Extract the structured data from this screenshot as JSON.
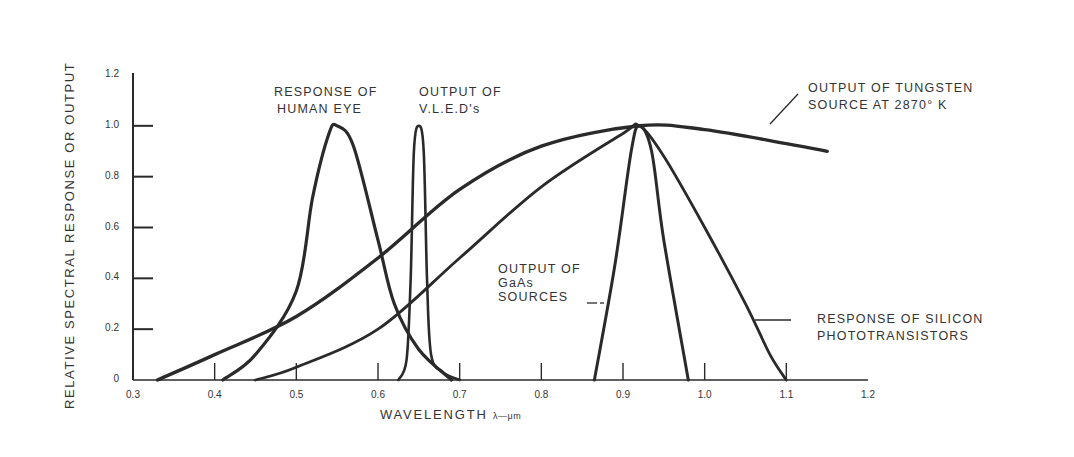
{
  "chart_data": {
    "type": "line",
    "title": "",
    "xlabel": "WAVELENGTH",
    "xlabel_unit": "λ—μm",
    "ylabel": "RELATIVE SPECTRAL RESPONSE OR OUTPUT",
    "xlim": [
      0.3,
      1.2
    ],
    "ylim": [
      0,
      1.2
    ],
    "grid": false,
    "x_ticks": [
      "0.3",
      "0.4",
      "0.5",
      "0.6",
      "0.7",
      "0.8",
      "0.9",
      "1.0",
      "1.1",
      "1.2"
    ],
    "y_ticks": [
      "0",
      "0.2",
      "0.4",
      "0.6",
      "0.8",
      "1.0",
      "1.2"
    ],
    "series": [
      {
        "name": "Response of Human Eye",
        "label": [
          "RESPONSE OF",
          "HUMAN EYE"
        ],
        "points": [
          [
            0.41,
            0.0
          ],
          [
            0.45,
            0.1
          ],
          [
            0.5,
            0.35
          ],
          [
            0.52,
            0.72
          ],
          [
            0.54,
            0.97
          ],
          [
            0.55,
            1.0
          ],
          [
            0.57,
            0.92
          ],
          [
            0.6,
            0.55
          ],
          [
            0.62,
            0.3
          ],
          [
            0.65,
            0.12
          ],
          [
            0.69,
            0.0
          ]
        ]
      },
      {
        "name": "Output of V.L.E.D's",
        "label": [
          "OUTPUT OF",
          "V.L.E.D's"
        ],
        "points": [
          [
            0.625,
            0.0
          ],
          [
            0.635,
            0.08
          ],
          [
            0.64,
            0.4
          ],
          [
            0.644,
            0.9
          ],
          [
            0.65,
            1.0
          ],
          [
            0.656,
            0.9
          ],
          [
            0.66,
            0.4
          ],
          [
            0.665,
            0.1
          ],
          [
            0.68,
            0.03
          ],
          [
            0.7,
            0.0
          ]
        ]
      },
      {
        "name": "Output of Tungsten Source at 2870°K",
        "label": [
          "OUTPUT OF TUNGSTEN",
          "SOURCE AT 2870° K"
        ],
        "points": [
          [
            0.33,
            0.0
          ],
          [
            0.4,
            0.1
          ],
          [
            0.5,
            0.25
          ],
          [
            0.6,
            0.48
          ],
          [
            0.7,
            0.75
          ],
          [
            0.8,
            0.92
          ],
          [
            0.92,
            1.0
          ],
          [
            1.0,
            0.985
          ],
          [
            1.1,
            0.93
          ],
          [
            1.15,
            0.9
          ]
        ]
      },
      {
        "name": "Output of GaAs Sources",
        "label": [
          "OUTPUT OF",
          "GaAs",
          "SOURCES"
        ],
        "points": [
          [
            0.865,
            0.0
          ],
          [
            0.89,
            0.45
          ],
          [
            0.91,
            0.9
          ],
          [
            0.92,
            1.0
          ],
          [
            0.935,
            0.9
          ],
          [
            0.95,
            0.55
          ],
          [
            0.98,
            0.0
          ]
        ]
      },
      {
        "name": "Response of Silicon Phototransistors",
        "label": [
          "RESPONSE OF SILICON",
          "PHOTOTRANSISTORS"
        ],
        "points": [
          [
            0.45,
            0.0
          ],
          [
            0.5,
            0.05
          ],
          [
            0.6,
            0.2
          ],
          [
            0.7,
            0.48
          ],
          [
            0.8,
            0.76
          ],
          [
            0.9,
            0.97
          ],
          [
            0.92,
            1.0
          ],
          [
            0.95,
            0.88
          ],
          [
            1.0,
            0.6
          ],
          [
            1.05,
            0.3
          ],
          [
            1.08,
            0.1
          ],
          [
            1.1,
            0.0
          ]
        ]
      }
    ],
    "annotations": [
      {
        "text": "RESPONSE OF\nHUMAN EYE"
      },
      {
        "text": "OUTPUT OF\nV.L.E.D's"
      },
      {
        "text": "OUTPUT OF TUNGSTEN\nSOURCE AT 2870° K"
      },
      {
        "text": "OUTPUT OF\nGaAs\nSOURCES"
      },
      {
        "text": "RESPONSE OF SILICON\nPHOTOTRANSISTORS"
      }
    ]
  },
  "labels": {
    "eye_1": "RESPONSE OF",
    "eye_2": "HUMAN EYE",
    "vled_1": "OUTPUT OF",
    "vled_2": "V.L.E.D's",
    "tung_1": "OUTPUT OF TUNGSTEN",
    "tung_2": "SOURCE AT 2870° K",
    "gaas_1": "OUTPUT OF",
    "gaas_2": "GaAs",
    "gaas_3": "SOURCES",
    "si_1": "RESPONSE OF SILICON",
    "si_2": "PHOTOTRANSISTORS",
    "xtitle": "WAVELENGTH",
    "xunit": "λ—μm",
    "ytitle": "RELATIVE SPECTRAL RESPONSE OR OUTPUT"
  },
  "style": {
    "line_color": "#2a2a2a",
    "background": "#ffffff"
  }
}
